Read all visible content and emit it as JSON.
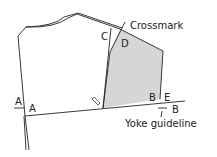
{
  "diagram": {
    "labels": {
      "crossmark": "Crossmark",
      "yoke_guideline": "Yoke guideline",
      "c": "C",
      "d": "D",
      "a_left": "A",
      "a_right": "A",
      "b_inner": "B",
      "e": "E",
      "b_outer": "B"
    },
    "colors": {
      "fill": "#d6d6d6",
      "line": "#222222"
    }
  }
}
